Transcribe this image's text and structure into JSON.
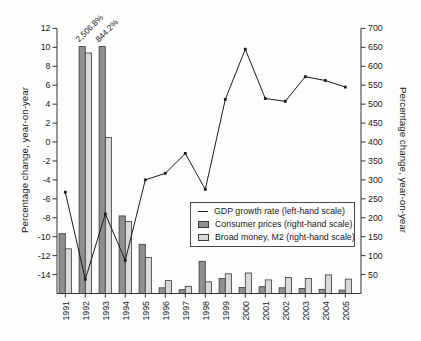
{
  "figure": {
    "width": 421,
    "height": 341,
    "background": "#fdfdfc"
  },
  "legend": {
    "items": [
      {
        "label": "GDP growth rate (left-hand scale)",
        "marker": "line-marker"
      },
      {
        "label": "Consumer prices (right-hand scale)",
        "marker": "dark-square-marker"
      },
      {
        "label": "Broad money, M2 (right-hand scale)",
        "marker": "light-square-marker"
      }
    ]
  },
  "colors": {
    "gdp_line": "#1a1a1a",
    "consumer_prices_fill": "#8f8f8f",
    "broad_money_fill": "#d9d9d9",
    "bar_stroke": "#3a3a3a",
    "axis": "#333333",
    "text": "#1a1a1a"
  },
  "chart_data": {
    "type": "combo-bar-line",
    "categories": [
      "1991",
      "1992",
      "1993",
      "1994",
      "1995",
      "1996",
      "1997",
      "1998",
      "1999",
      "2000",
      "2001",
      "2002",
      "2003",
      "2004",
      "2005"
    ],
    "series": [
      {
        "name": "GDP growth rate (left-hand scale)",
        "type": "line",
        "axis": "left",
        "values": [
          -5.3,
          -14.5,
          -7.6,
          -12.5,
          -4.0,
          -3.3,
          -1.2,
          -5.0,
          4.5,
          9.8,
          4.6,
          4.3,
          6.9,
          6.5,
          5.8
        ]
      },
      {
        "name": "Consumer prices (right-hand scale)",
        "type": "bar",
        "axis": "right",
        "values": [
          158,
          2506.8,
          844.2,
          205,
          130,
          15,
          10,
          85,
          40,
          16,
          18,
          15,
          13,
          11,
          9
        ]
      },
      {
        "name": "Broad money, M2 (right-hand scale)",
        "type": "bar",
        "axis": "right",
        "values": [
          118,
          635,
          412,
          190,
          95,
          34,
          19,
          31,
          52,
          54,
          36,
          42,
          40,
          49,
          38
        ]
      }
    ],
    "left_axis": {
      "label": "Percentage change, year-on-year",
      "min": -16,
      "max": 12,
      "ticks": [
        12,
        10,
        8,
        6,
        4,
        2,
        0,
        -2,
        -4,
        -6,
        -8,
        -10,
        -12,
        -14
      ]
    },
    "right_axis": {
      "label": "Percentage change, year-on-year",
      "min": 0,
      "max": 700,
      "ticks": [
        700,
        650,
        600,
        550,
        500,
        450,
        400,
        350,
        300,
        250,
        200,
        150,
        100,
        50
      ]
    },
    "bar_clip_max": 652,
    "annotations": [
      {
        "text": "2,506.8%",
        "category": "1992",
        "series": "Consumer prices (right-hand scale)"
      },
      {
        "text": "844.2%",
        "category": "1993",
        "series": "Consumer prices (right-hand scale)"
      }
    ],
    "grid": false,
    "legend_position": "middle-right",
    "title": ""
  }
}
